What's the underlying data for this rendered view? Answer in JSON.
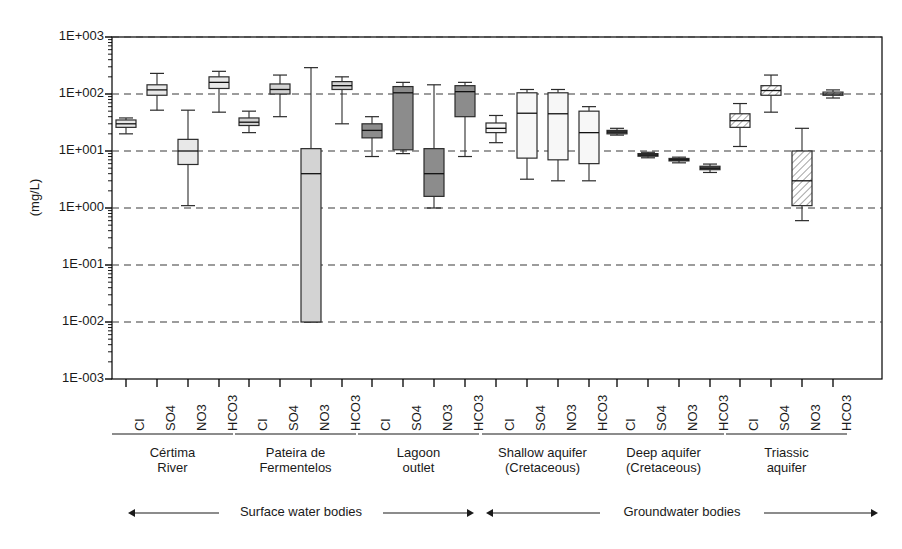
{
  "chart_data": {
    "type": "box",
    "title": "",
    "ylabel": "(mg/L)",
    "xlabel": "",
    "yscale": "log",
    "ylim": [
      0.001,
      1000
    ],
    "grid": true,
    "legend": "none",
    "ytick_labels": [
      "1E+003",
      "1E+002",
      "1E+001",
      "1E+000",
      "1E-001",
      "1E-002",
      "1E-003"
    ],
    "ytick_values": [
      1000,
      100,
      10,
      1,
      0.1,
      0.01,
      0.001
    ],
    "categories": [
      "Cl",
      "SO4",
      "NO3",
      "HCO3"
    ],
    "groups": [
      {
        "name": "Cértima\nRiver",
        "section": "Surface water bodies",
        "fill": "#e8e8e8",
        "pattern": "solid",
        "boxes": [
          {
            "label": "Cl",
            "whisker_low": 20.0,
            "q1": 26.0,
            "median": 30.0,
            "q3": 35.0,
            "whisker_high": 38.0
          },
          {
            "label": "SO4",
            "whisker_low": 52.0,
            "q1": 95.0,
            "median": 118.0,
            "q3": 145.0,
            "whisker_high": 230.0
          },
          {
            "label": "NO3",
            "whisker_low": 1.1,
            "q1": 5.8,
            "median": 10.0,
            "q3": 16.0,
            "whisker_high": 52.0
          },
          {
            "label": "HCO3",
            "whisker_low": 48.0,
            "q1": 125.0,
            "median": 160.0,
            "q3": 200.0,
            "whisker_high": 250.0
          }
        ]
      },
      {
        "name": "Pateira de\nFermentelos",
        "section": "Surface water bodies",
        "fill": "#d3d3d3",
        "pattern": "solid",
        "boxes": [
          {
            "label": "Cl",
            "whisker_low": 21.0,
            "q1": 28.0,
            "median": 32.0,
            "q3": 38.0,
            "whisker_high": 50.0
          },
          {
            "label": "SO4",
            "whisker_low": 40.0,
            "q1": 100.0,
            "median": 120.0,
            "q3": 150.0,
            "whisker_high": 215.0
          },
          {
            "label": "NO3",
            "whisker_low": 0.01,
            "q1": 0.01,
            "median": 4.0,
            "q3": 11.0,
            "whisker_high": 290.0
          },
          {
            "label": "HCO3",
            "whisker_low": 30.0,
            "q1": 120.0,
            "median": 140.0,
            "q3": 165.0,
            "whisker_high": 200.0
          }
        ]
      },
      {
        "name": "Lagoon\noutlet",
        "section": "Surface water bodies",
        "fill": "#8c8c8c",
        "pattern": "solid",
        "boxes": [
          {
            "label": "Cl",
            "whisker_low": 8.0,
            "q1": 17.0,
            "median": 23.0,
            "q3": 30.0,
            "whisker_high": 40.0
          },
          {
            "label": "SO4",
            "whisker_low": 9.0,
            "q1": 10.5,
            "median": 105.0,
            "q3": 135.0,
            "whisker_high": 160.0
          },
          {
            "label": "NO3",
            "whisker_low": 1.0,
            "q1": 1.6,
            "median": 4.0,
            "q3": 11.0,
            "whisker_high": 145.0
          },
          {
            "label": "HCO3",
            "whisker_low": 8.0,
            "q1": 40.0,
            "median": 110.0,
            "q3": 140.0,
            "whisker_high": 160.0
          }
        ]
      },
      {
        "name": "Shallow aquifer\n(Cretaceous)",
        "section": "Groundwater bodies",
        "fill": "#f7f7f7",
        "pattern": "solid",
        "boxes": [
          {
            "label": "Cl",
            "whisker_low": 14.0,
            "q1": 21.0,
            "median": 25.0,
            "q3": 31.0,
            "whisker_high": 42.0
          },
          {
            "label": "SO4",
            "whisker_low": 3.2,
            "q1": 7.5,
            "median": 46.0,
            "q3": 105.0,
            "whisker_high": 120.0
          },
          {
            "label": "NO3",
            "whisker_low": 3.0,
            "q1": 7.0,
            "median": 45.0,
            "q3": 105.0,
            "whisker_high": 120.0
          },
          {
            "label": "HCO3",
            "whisker_low": 3.0,
            "q1": 6.0,
            "median": 21.0,
            "q3": 50.0,
            "whisker_high": 60.0
          }
        ]
      },
      {
        "name": "Deep aquifer\n(Cretaceous)",
        "section": "Groundwater bodies",
        "fill": "#606060",
        "pattern": "solid",
        "boxes": [
          {
            "label": "Cl",
            "whisker_low": 19.0,
            "q1": 20.0,
            "median": 21.5,
            "q3": 23.0,
            "whisker_high": 25.0
          },
          {
            "label": "SO4",
            "whisker_low": 7.6,
            "q1": 8.1,
            "median": 8.5,
            "q3": 9.0,
            "whisker_high": 9.5
          },
          {
            "label": "NO3",
            "whisker_low": 6.2,
            "q1": 6.7,
            "median": 7.0,
            "q3": 7.4,
            "whisker_high": 7.8
          },
          {
            "label": "HCO3",
            "whisker_low": 4.2,
            "q1": 4.7,
            "median": 5.0,
            "q3": 5.4,
            "whisker_high": 5.9
          }
        ]
      },
      {
        "name": "Triassic\naquifer",
        "section": "Groundwater bodies",
        "fill": "#ffffff",
        "pattern": "hatch",
        "boxes": [
          {
            "label": "Cl",
            "whisker_low": 12.0,
            "q1": 26.0,
            "median": 34.0,
            "q3": 45.0,
            "whisker_high": 68.0
          },
          {
            "label": "SO4",
            "whisker_low": 48.0,
            "q1": 95.0,
            "median": 115.0,
            "q3": 140.0,
            "whisker_high": 215.0
          },
          {
            "label": "NO3",
            "whisker_low": 0.6,
            "q1": 1.1,
            "median": 3.0,
            "q3": 10.0,
            "whisker_high": 25.0
          },
          {
            "label": "HCO3",
            "whisker_low": 85.0,
            "q1": 95.0,
            "median": 100.0,
            "q3": 108.0,
            "whisker_high": 118.0
          }
        ]
      }
    ],
    "sections": [
      {
        "label": "Surface water bodies"
      },
      {
        "label": "Groundwater bodies"
      }
    ]
  }
}
